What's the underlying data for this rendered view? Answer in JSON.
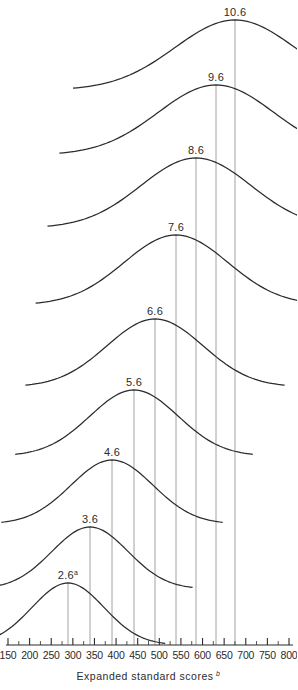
{
  "chart_data": {
    "type": "line",
    "title": "",
    "xlabel": "Expanded standard scores",
    "xlabel_superscript": "b",
    "ylabel": "",
    "xlim": [
      150,
      800
    ],
    "grid": false,
    "legend": false,
    "x_ticks_major": [
      150,
      200,
      250,
      300,
      350,
      400,
      450,
      500,
      550,
      600,
      650,
      700,
      750,
      800
    ],
    "x_tick_labels": [
      "150",
      "200",
      "250",
      "300",
      "350",
      "400",
      "450",
      "500",
      "550",
      "600",
      "650",
      "700",
      "750",
      "800"
    ],
    "x_tick_minor_step": 25,
    "series": [
      {
        "name": "2.6",
        "label": "2.6",
        "superscript": "a",
        "mean": 293,
        "peak_px": 68,
        "sd_px": 36,
        "amplitude_px": 62,
        "baseline_px": 645,
        "peak_y_px": 583
      },
      {
        "name": "3.6",
        "label": "3.6",
        "superscript": "",
        "mean": 330,
        "peak_px": 90,
        "sd_px": 38,
        "amplitude_px": 62,
        "baseline_px": 589,
        "peak_y_px": 527
      },
      {
        "name": "4.6",
        "label": "4.6",
        "superscript": "",
        "mean": 372,
        "peak_px": 112,
        "sd_px": 41,
        "amplitude_px": 64,
        "baseline_px": 524,
        "peak_y_px": 460
      },
      {
        "name": "5.6",
        "label": "5.6",
        "superscript": "",
        "mean": 410,
        "peak_px": 134,
        "sd_px": 44,
        "amplitude_px": 66,
        "baseline_px": 456,
        "peak_y_px": 390
      },
      {
        "name": "6.6",
        "label": "6.6",
        "superscript": "",
        "mean": 450,
        "peak_px": 155,
        "sd_px": 48,
        "amplitude_px": 68,
        "baseline_px": 387,
        "peak_y_px": 319
      },
      {
        "name": "7.6",
        "label": "7.6",
        "superscript": "",
        "mean": 490,
        "peak_px": 176,
        "sd_px": 52,
        "amplitude_px": 70,
        "baseline_px": 305,
        "peak_y_px": 235
      },
      {
        "name": "8.6",
        "label": "8.6",
        "superscript": "",
        "mean": 530,
        "peak_px": 196,
        "sd_px": 55,
        "amplitude_px": 70,
        "baseline_px": 228,
        "peak_y_px": 158
      },
      {
        "name": "9.6",
        "label": "9.6",
        "superscript": "",
        "mean": 575,
        "peak_px": 216,
        "sd_px": 58,
        "amplitude_px": 70,
        "baseline_px": 155,
        "peak_y_px": 85
      },
      {
        "name": "10.6",
        "label": "10.6",
        "superscript": "",
        "mean": 615,
        "peak_px": 235,
        "sd_px": 60,
        "amplitude_px": 70,
        "baseline_px": 90,
        "peak_y_px": 20
      }
    ]
  },
  "axis": {
    "baseline_y_px": 645,
    "left_px": 8,
    "right_px": 289,
    "title_y_px": 680
  },
  "colors": {
    "curve": "#2b2b2b",
    "peak_line": "#8a8a8a",
    "axis": "#2b2b2b",
    "background": "#ffffff",
    "text": "#2b2b2b"
  }
}
